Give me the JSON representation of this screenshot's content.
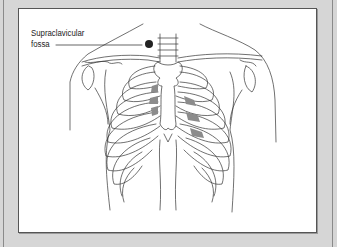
{
  "figure": {
    "label": {
      "line1": "Supraclavicular",
      "line2": "fossa"
    },
    "colors": {
      "background": "#d6d6d6",
      "panel": "#ffffff",
      "line": "#333333",
      "marker": "#222222",
      "shaded_spaces": "#8c8c8c"
    },
    "elements": [
      "clavicles",
      "sternum",
      "rib-cage",
      "shoulders",
      "supraclavicular-fossa-marker",
      "shaded-intercostal-spaces"
    ]
  }
}
